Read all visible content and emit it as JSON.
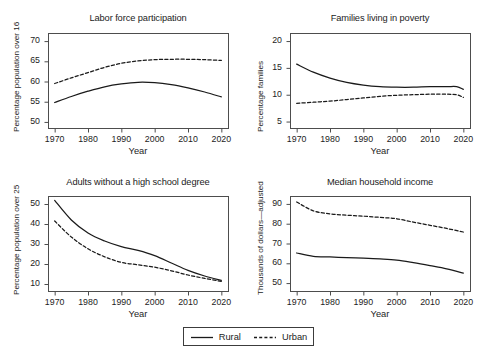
{
  "figure": {
    "background": "#ffffff",
    "line_color": "#1a1a1a",
    "axis_color": "#4d4d4d"
  },
  "legend": {
    "position": "bottom-center",
    "entries": [
      {
        "label": "Rural",
        "style": "solid",
        "icon": "solid-line-icon"
      },
      {
        "label": "Urban",
        "style": "dashed",
        "icon": "dashed-line-icon"
      }
    ]
  },
  "chart_data": [
    {
      "type": "line",
      "title": "Labor force participation",
      "xlabel": "Year",
      "ylabel": "Percentage population over 16",
      "xlim": [
        1968,
        2022
      ],
      "ylim": [
        48.5,
        72
      ],
      "xticks": [
        1970,
        1980,
        1990,
        2000,
        2010,
        2020
      ],
      "yticks": [
        50,
        55,
        60,
        65,
        70
      ],
      "grid": false,
      "x": [
        1970,
        1975,
        1980,
        1985,
        1990,
        1995,
        2000,
        2005,
        2010,
        2015,
        2020
      ],
      "series": [
        {
          "name": "Rural",
          "style": "solid",
          "values": [
            54.8,
            56.3,
            57.6,
            58.7,
            59.4,
            59.8,
            59.7,
            59.2,
            58.4,
            57.4,
            56.2
          ]
        },
        {
          "name": "Urban",
          "style": "dashed",
          "values": [
            59.5,
            60.9,
            62.2,
            63.5,
            64.5,
            65.1,
            65.4,
            65.5,
            65.5,
            65.4,
            65.2
          ]
        }
      ]
    },
    {
      "type": "line",
      "title": "Families living in poverty",
      "xlabel": "Year",
      "ylabel": "Percentage families",
      "xlim": [
        1968,
        2022
      ],
      "ylim": [
        3.8,
        21.5
      ],
      "xticks": [
        1970,
        1980,
        1990,
        2000,
        2010,
        2020
      ],
      "yticks": [
        5,
        10,
        15,
        20
      ],
      "grid": false,
      "x": [
        1970,
        1975,
        1980,
        1985,
        1990,
        1995,
        2000,
        2005,
        2010,
        2015,
        2018,
        2020
      ],
      "series": [
        {
          "name": "Rural",
          "style": "solid",
          "values": [
            15.7,
            14.2,
            13.1,
            12.3,
            11.8,
            11.5,
            11.4,
            11.4,
            11.5,
            11.5,
            11.5,
            11.0
          ]
        },
        {
          "name": "Urban",
          "style": "dashed",
          "values": [
            8.4,
            8.6,
            8.8,
            9.1,
            9.4,
            9.7,
            9.9,
            10.0,
            10.1,
            10.1,
            10.0,
            9.5
          ]
        }
      ]
    },
    {
      "type": "line",
      "title": "Adults without a high school degree",
      "xlabel": "Year",
      "ylabel": "Percentage population over 25",
      "xlim": [
        1968,
        2022
      ],
      "ylim": [
        6.5,
        54
      ],
      "xticks": [
        1970,
        1980,
        1990,
        2000,
        2010,
        2020
      ],
      "yticks": [
        10,
        20,
        30,
        40,
        50
      ],
      "grid": false,
      "x": [
        1970,
        1975,
        1980,
        1985,
        1990,
        1995,
        2000,
        2005,
        2010,
        2015,
        2020
      ],
      "series": [
        {
          "name": "Rural",
          "style": "solid",
          "values": [
            51.8,
            42.0,
            35.5,
            31.5,
            28.7,
            26.8,
            24.2,
            20.5,
            16.8,
            14.0,
            11.8
          ]
        },
        {
          "name": "Urban",
          "style": "dashed",
          "values": [
            41.5,
            33.5,
            27.6,
            23.6,
            20.8,
            19.6,
            18.4,
            16.6,
            14.5,
            12.8,
            11.3
          ]
        }
      ]
    },
    {
      "type": "line",
      "title": "Median household income",
      "xlabel": "Year",
      "ylabel": "Thousands of dollars—adjusted",
      "xlim": [
        1968,
        2022
      ],
      "ylim": [
        46,
        94
      ],
      "xticks": [
        1970,
        1980,
        1990,
        2000,
        2010,
        2020
      ],
      "yticks": [
        50,
        60,
        70,
        80,
        90
      ],
      "grid": false,
      "x": [
        1970,
        1975,
        1980,
        1985,
        1990,
        1995,
        2000,
        2005,
        2010,
        2015,
        2020
      ],
      "series": [
        {
          "name": "Rural",
          "style": "solid",
          "values": [
            65.2,
            63.5,
            63.2,
            62.9,
            62.6,
            62.2,
            61.6,
            60.3,
            58.8,
            57.2,
            55.0
          ]
        },
        {
          "name": "Urban",
          "style": "dashed",
          "values": [
            91.0,
            86.5,
            85.0,
            84.3,
            83.8,
            83.2,
            82.5,
            80.8,
            79.2,
            77.6,
            75.8
          ]
        }
      ]
    }
  ]
}
